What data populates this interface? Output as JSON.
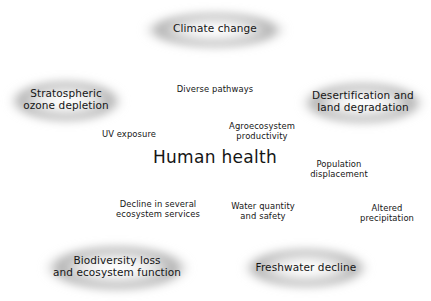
{
  "figure": {
    "center": {
      "label": "Human health"
    },
    "colors": {
      "blob": "#b9b9b9",
      "stroke": "#1a1a1a",
      "text": "#151515",
      "background": "#ffffff",
      "arrow_fill": "#ffffff"
    }
  },
  "nodes": [
    {
      "id": "climate-change",
      "label": "Climate change",
      "x": 215,
      "y": 30,
      "rx": 72,
      "ry": 20
    },
    {
      "id": "stratospheric-ozone-depletion",
      "label": "Stratospheric\nozone depletion",
      "x": 66,
      "y": 101,
      "rx": 57,
      "ry": 22
    },
    {
      "id": "desertification-land-degradation",
      "label": "Desertification and\nland degradation",
      "x": 363,
      "y": 103,
      "rx": 62,
      "ry": 22
    },
    {
      "id": "biodiversity-loss-ecosystem-function",
      "label": "Biodiversity loss\nand ecosystem function",
      "x": 117,
      "y": 267,
      "rx": 72,
      "ry": 24
    },
    {
      "id": "freshwater-decline",
      "label": "Freshwater decline",
      "x": 306,
      "y": 267,
      "rx": 62,
      "ry": 21
    }
  ],
  "edge_labels": [
    {
      "id": "diverse-pathways",
      "label": "Diverse pathways",
      "x": 215,
      "y": 89
    },
    {
      "id": "uv-exposure",
      "label": "UV exposure",
      "x": 128,
      "y": 134
    },
    {
      "id": "agroecosystem-productivity",
      "label": "Agroecosystem\nproductivity",
      "x": 261,
      "y": 129
    },
    {
      "id": "population-displacement",
      "label": "Population\ndisplacement",
      "x": 338,
      "y": 170
    },
    {
      "id": "altered-precipitation",
      "label": "Altered\nprecipitation",
      "x": 385,
      "y": 216
    },
    {
      "id": "decline-ecosystem-services",
      "label": "Decline in several\necosystem services",
      "x": 158,
      "y": 212
    },
    {
      "id": "water-quantity-safety",
      "label": "Water quantity\nand safety",
      "x": 262,
      "y": 213
    }
  ],
  "connections": [
    {
      "id": "ozone-climate",
      "from": "stratospheric-ozone-depletion",
      "to": "climate-change",
      "type": "bidirectional"
    },
    {
      "id": "climate-desertification",
      "from": "climate-change",
      "to": "desertification-land-degradation",
      "type": "bidirectional"
    },
    {
      "id": "climate-human-health",
      "from": "climate-change",
      "to": "center",
      "type": "unidirectional",
      "label": "Diverse pathways"
    },
    {
      "id": "ozone-biodiversity",
      "from": "stratospheric-ozone-depletion",
      "to": "biodiversity-loss-ecosystem-function",
      "type": "unidirectional"
    },
    {
      "id": "desertification-freshwater",
      "from": "desertification-land-degradation",
      "to": "freshwater-decline",
      "type": "bidirectional"
    },
    {
      "id": "biodiversity-freshwater",
      "from": "biodiversity-loss-ecosystem-function",
      "to": "freshwater-decline",
      "type": "bidirectional"
    },
    {
      "id": "ozone-health",
      "from": "stratospheric-ozone-depletion",
      "to": "center",
      "type": "unidirectional",
      "label": "UV exposure"
    },
    {
      "id": "desertification-health",
      "from": "desertification-land-degradation",
      "to": "center",
      "type": "unidirectional",
      "label": "Agroecosystem productivity"
    },
    {
      "id": "biodiversity-health",
      "from": "biodiversity-loss-ecosystem-function",
      "to": "center",
      "type": "unidirectional",
      "label": "Decline in several ecosystem services"
    },
    {
      "id": "freshwater-health",
      "from": "freshwater-decline",
      "to": "center",
      "type": "unidirectional",
      "label": "Water quantity and safety"
    },
    {
      "id": "population-displacement-health",
      "from": "desertification-land-degradation",
      "to": "center",
      "type": "unidirectional",
      "label": "Population displacement"
    },
    {
      "id": "altered-precipitation-freshwater",
      "from": "desertification-land-degradation",
      "to": "freshwater-decline",
      "type": "unidirectional",
      "label": "Altered precipitation"
    }
  ]
}
